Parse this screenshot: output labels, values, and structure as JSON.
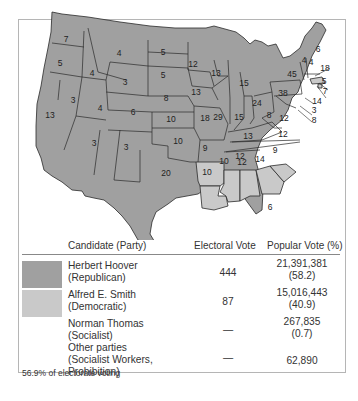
{
  "colors": {
    "republican": "#a0a0a0",
    "democratic": "#c9c9c9",
    "state_border": "#2a2a2a",
    "frame_border": "#b5b5b5"
  },
  "map": {
    "title": "Election of 1928",
    "state_labels": [
      {
        "state": "Washington",
        "votes": "7",
        "party": "republican"
      },
      {
        "state": "Oregon",
        "votes": "5",
        "party": "republican"
      },
      {
        "state": "California",
        "votes": "13",
        "party": "republican"
      },
      {
        "state": "Idaho",
        "votes": "4",
        "party": "republican"
      },
      {
        "state": "Nevada",
        "votes": "3",
        "party": "republican"
      },
      {
        "state": "Montana",
        "votes": "4",
        "party": "republican"
      },
      {
        "state": "Wyoming",
        "votes": "3",
        "party": "republican"
      },
      {
        "state": "Utah",
        "votes": "4",
        "party": "republican"
      },
      {
        "state": "Arizona",
        "votes": "3",
        "party": "republican"
      },
      {
        "state": "Colorado",
        "votes": "6",
        "party": "republican"
      },
      {
        "state": "New Mexico",
        "votes": "3",
        "party": "republican"
      },
      {
        "state": "North Dakota",
        "votes": "5",
        "party": "republican"
      },
      {
        "state": "South Dakota",
        "votes": "5",
        "party": "republican"
      },
      {
        "state": "Nebraska",
        "votes": "8",
        "party": "republican"
      },
      {
        "state": "Kansas",
        "votes": "10",
        "party": "republican"
      },
      {
        "state": "Oklahoma",
        "votes": "10",
        "party": "republican"
      },
      {
        "state": "Texas",
        "votes": "20",
        "party": "republican"
      },
      {
        "state": "Minnesota",
        "votes": "12",
        "party": "republican"
      },
      {
        "state": "Iowa",
        "votes": "13",
        "party": "republican"
      },
      {
        "state": "Missouri",
        "votes": "18",
        "party": "republican"
      },
      {
        "state": "Arkansas",
        "votes": "9",
        "party": "democratic"
      },
      {
        "state": "Louisiana",
        "votes": "10",
        "party": "democratic"
      },
      {
        "state": "Wisconsin",
        "votes": "13",
        "party": "republican"
      },
      {
        "state": "Illinois",
        "votes": "29",
        "party": "republican"
      },
      {
        "state": "Michigan",
        "votes": "15",
        "party": "republican"
      },
      {
        "state": "Indiana",
        "votes": "15",
        "party": "republican"
      },
      {
        "state": "Ohio",
        "votes": "24",
        "party": "republican"
      },
      {
        "state": "Kentucky",
        "votes": "13",
        "party": "republican"
      },
      {
        "state": "Tennessee",
        "votes": "12",
        "party": "republican"
      },
      {
        "state": "Mississippi",
        "votes": "10",
        "party": "democratic"
      },
      {
        "state": "Alabama",
        "votes": "12",
        "party": "democratic"
      },
      {
        "state": "Georgia",
        "votes": "14",
        "party": "democratic"
      },
      {
        "state": "South Carolina",
        "votes": "9",
        "party": "democratic"
      },
      {
        "state": "North Carolina",
        "votes": "12",
        "party": "republican"
      },
      {
        "state": "Virginia",
        "votes": "12",
        "party": "republican"
      },
      {
        "state": "West Virginia",
        "votes": "8",
        "party": "republican"
      },
      {
        "state": "Florida",
        "votes": "6",
        "party": "republican"
      },
      {
        "state": "Pennsylvania",
        "votes": "38",
        "party": "republican"
      },
      {
        "state": "New York",
        "votes": "45",
        "party": "republican"
      },
      {
        "state": "Vermont",
        "votes": "4",
        "party": "republican"
      },
      {
        "state": "New Hampshire",
        "votes": "4",
        "party": "republican"
      },
      {
        "state": "Maine",
        "votes": "6",
        "party": "republican"
      },
      {
        "state": "Massachusetts",
        "votes": "18",
        "party": "democratic"
      },
      {
        "state": "Rhode Island",
        "votes": "5",
        "party": "democratic"
      },
      {
        "state": "Connecticut",
        "votes": "7",
        "party": "republican"
      },
      {
        "state": "New Jersey",
        "votes": "14",
        "party": "republican"
      },
      {
        "state": "Delaware",
        "votes": "3",
        "party": "republican"
      },
      {
        "state": "Maryland",
        "votes": "8",
        "party": "republican"
      }
    ]
  },
  "legend": {
    "headers": {
      "candidate": "Candidate (Party)",
      "electoral": "Electoral Vote",
      "popular": "Popular Vote (%)"
    },
    "rows": [
      {
        "name": "Herbert Hoover",
        "party": "(Republican)",
        "electoral": "444",
        "popular": "21,391,381",
        "percent": "(58.2)",
        "swatch": "republican"
      },
      {
        "name": "Alfred E. Smith",
        "party": "(Democratic)",
        "electoral": "87",
        "popular": "15,016,443",
        "percent": "(40.9)",
        "swatch": "democratic"
      },
      {
        "name": "Norman Thomas",
        "party": "(Socialist)",
        "electoral": "—",
        "popular": "267,835",
        "percent": "(0.7)",
        "swatch": null
      },
      {
        "name": "Other parties",
        "party": "(Socialist Workers,",
        "party2": "Prohibition)",
        "electoral": "—",
        "popular": "62,890",
        "percent": "",
        "swatch": null
      }
    ],
    "note": "56.9% of electorate voting"
  }
}
